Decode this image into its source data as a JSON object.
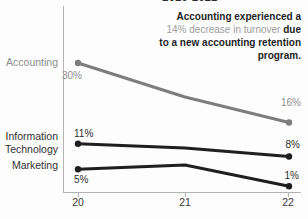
{
  "chart_data": {
    "type": "line",
    "title_clipped": "2020-2022",
    "x": [
      2020,
      2021,
      2022
    ],
    "x_tick_labels": [
      "20",
      "21",
      "22"
    ],
    "xlabel": "",
    "ylabel": "",
    "grid": false,
    "legend": "direct-labels-left",
    "series": [
      {
        "name": "Accounting",
        "slug": "accounting",
        "color": "#7d7d7d",
        "values": [
          30,
          22,
          16
        ],
        "start_label": "30%",
        "end_label": "16%"
      },
      {
        "name": "Information Technology",
        "slug": "information-technology",
        "color": "#1f1f1f",
        "values": [
          11,
          10,
          8
        ],
        "start_label": "11%",
        "end_label": "8%"
      },
      {
        "name": "Marketing",
        "slug": "marketing",
        "color": "#1f1f1f",
        "values": [
          5,
          6,
          1
        ],
        "start_label": "5%",
        "end_label": "1%"
      }
    ]
  },
  "labels": {
    "accounting": "Accounting",
    "information": "Information",
    "technology": "Technology",
    "marketing": "Marketing"
  },
  "annotation": {
    "line1": "Accounting experienced a",
    "line2_gray": "14% decrease in turnover",
    "line2_bold": " due",
    "line3": "to a new accounting retention",
    "line4": "program."
  },
  "colors": {
    "accounting_line": "#7d7d7d",
    "dark_line": "#1f1f1f",
    "gray_text": "#8f8f8f",
    "annotation_gray": "#9e9e9e",
    "axis": "#b3b3b3"
  }
}
